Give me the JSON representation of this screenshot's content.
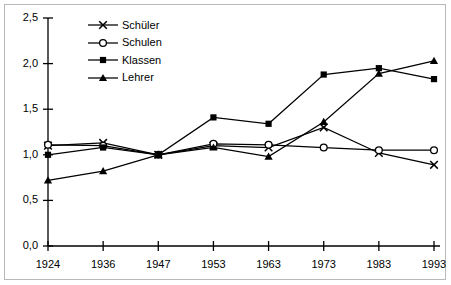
{
  "chart_data": {
    "type": "line",
    "title": "",
    "xlabel": "",
    "ylabel": "",
    "categories": [
      "1924",
      "1936",
      "1947",
      "1953",
      "1963",
      "1973",
      "1983",
      "1993"
    ],
    "ylim": [
      0.0,
      2.5
    ],
    "ytick_labels": [
      "0,0",
      "0,5",
      "1,0",
      "1,5",
      "2,0",
      "2,5"
    ],
    "ytick_values": [
      0.0,
      0.5,
      1.0,
      1.5,
      2.0,
      2.5
    ],
    "grid": false,
    "legend_position": "top-left-inside",
    "series": [
      {
        "name": "Schüler",
        "marker": "x-cross",
        "values": [
          1.1,
          1.13,
          1.0,
          1.1,
          1.08,
          1.3,
          1.02,
          0.89
        ]
      },
      {
        "name": "Schulen",
        "marker": "open-circle",
        "values": [
          1.11,
          1.1,
          1.0,
          1.12,
          1.11,
          1.08,
          1.05,
          1.05
        ]
      },
      {
        "name": "Klassen",
        "marker": "filled-square",
        "values": [
          1.0,
          1.08,
          1.0,
          1.41,
          1.34,
          1.88,
          1.95,
          1.83
        ]
      },
      {
        "name": "Lehrer",
        "marker": "filled-triangle",
        "values": [
          0.72,
          0.82,
          1.0,
          1.08,
          0.98,
          1.36,
          1.89,
          2.03
        ]
      }
    ]
  },
  "style": {
    "line_color": "#000000",
    "axis_color": "#000000",
    "frame_color": "#b9b9b9",
    "background": "#ffffff"
  }
}
